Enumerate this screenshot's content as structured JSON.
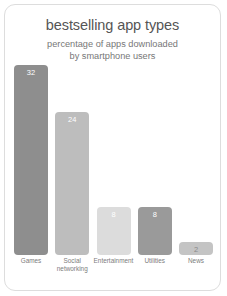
{
  "chart_data": {
    "type": "bar",
    "title": "bestselling app types",
    "subtitle_lines": [
      "percentage of apps downloaded",
      "by smartphone users"
    ],
    "categories": [
      "Games",
      "Social networking",
      "Entertainment",
      "Utilities",
      "News"
    ],
    "category_lines": [
      [
        "Games"
      ],
      [
        "Social",
        "networking"
      ],
      [
        "Entertainment"
      ],
      [
        "Utilities"
      ],
      [
        "News"
      ]
    ],
    "values": [
      32,
      24,
      8,
      8,
      2
    ],
    "value_labels": [
      "32",
      "24",
      "8",
      "8",
      "2"
    ],
    "xlabel": "",
    "ylabel": "",
    "ylim": [
      0,
      32
    ],
    "grid": false,
    "legend": false,
    "bar_colors": [
      "#8e8e8e",
      "#bdbdbd",
      "#dcdcdc",
      "#9a9a9a",
      "#c4c4c4"
    ],
    "value_label_colors": [
      "#ffffff",
      "#ffffff",
      "#ffffff",
      "#ffffff",
      "#8a8a8a"
    ]
  },
  "card": {
    "background": "#ffffff",
    "border_color": "#dddddd"
  }
}
